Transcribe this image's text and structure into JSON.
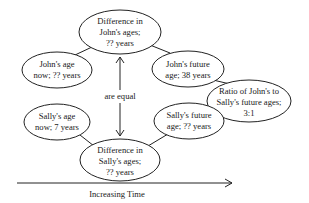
{
  "diagram": {
    "type": "concept-map",
    "nodes": [
      {
        "id": "diff_john",
        "lines": [
          "Difference in",
          "John's ages;",
          "?? years"
        ]
      },
      {
        "id": "john_now",
        "lines": [
          "John's age",
          "now; ??  years"
        ]
      },
      {
        "id": "john_future",
        "lines": [
          "John's future",
          "age; 38  years"
        ]
      },
      {
        "id": "ratio",
        "lines": [
          "Ratio of John's to",
          "Sally's future ages;",
          "3:1"
        ]
      },
      {
        "id": "sally_now",
        "lines": [
          "Sally's age",
          "now; 7  years"
        ]
      },
      {
        "id": "sally_future",
        "lines": [
          "Sally's future",
          "age;  ?? years"
        ]
      },
      {
        "id": "diff_sally",
        "lines": [
          "Difference in",
          "Sally's ages;",
          "?? years"
        ]
      }
    ],
    "edges": [
      {
        "from": "john_now",
        "to": "diff_john"
      },
      {
        "from": "diff_john",
        "to": "john_future"
      },
      {
        "from": "john_future",
        "to": "ratio"
      },
      {
        "from": "sally_future",
        "to": "ratio"
      },
      {
        "from": "sally_now",
        "to": "diff_sally"
      },
      {
        "from": "diff_sally",
        "to": "sally_future"
      },
      {
        "from": "diff_john",
        "to": "diff_sally",
        "label": "are equal",
        "style": "double-arrow"
      }
    ],
    "equal_label": "are equal",
    "axis_label": "Increasing Time"
  },
  "colors": {
    "stroke": "#222222",
    "text": "#1a1a1a",
    "background": "#ffffff"
  }
}
